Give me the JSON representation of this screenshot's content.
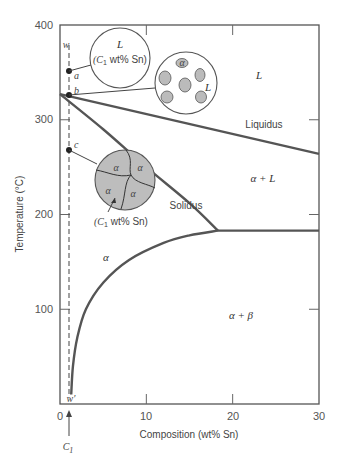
{
  "chart_data": {
    "type": "line",
    "title": "",
    "xlabel": "Composition (wt% Sn)",
    "ylabel": "Temperature (°C)",
    "xlim": [
      0,
      30
    ],
    "ylim": [
      0,
      400
    ],
    "x_ticks": [
      0,
      10,
      20,
      30
    ],
    "y_ticks": [
      100,
      200,
      300,
      400
    ],
    "x_tick_labels": [
      "0",
      "10",
      "20",
      "30"
    ],
    "y_tick_labels": [
      "100",
      "200",
      "300",
      "400"
    ],
    "series": [
      {
        "name": "Liquidus",
        "x": [
          0,
          30
        ],
        "y": [
          327,
          264
        ]
      },
      {
        "name": "Solidus",
        "x": [
          0,
          5,
          10,
          15,
          18.3
        ],
        "y": [
          327,
          290,
          250,
          212,
          183
        ]
      },
      {
        "name": "Eutectic isotherm",
        "x": [
          18.3,
          30
        ],
        "y": [
          183,
          183
        ]
      },
      {
        "name": "Solvus",
        "x": [
          1.3,
          1.5,
          2,
          3,
          5,
          8,
          12,
          15,
          18.3
        ],
        "y": [
          10,
          40,
          70,
          100,
          128,
          152,
          170,
          178,
          183
        ]
      }
    ],
    "composition_line": {
      "label_top": "w",
      "label_bottom": "w′",
      "composition": 1,
      "label": "C1"
    },
    "points": [
      {
        "label": "a",
        "composition": 1,
        "temperature": 350
      },
      {
        "label": "b",
        "composition": 1,
        "temperature": 327
      },
      {
        "label": "c",
        "composition": 1,
        "temperature": 268
      }
    ],
    "phase_regions": [
      {
        "label": "L",
        "x": 23,
        "y": 345
      },
      {
        "label": "α + L",
        "x": 23.5,
        "y": 238
      },
      {
        "label": "α",
        "x": 5,
        "y": 155
      },
      {
        "label": "α + β",
        "x": 21,
        "y": 95
      }
    ],
    "curve_labels": [
      {
        "label": "Liquidus",
        "x": 24,
        "y": 293
      },
      {
        "label": "Solidus",
        "x": 14.5,
        "y": 200
      }
    ],
    "microstructures": [
      {
        "point": "a",
        "phase_label": "L",
        "caption": "(C1 wt% Sn)"
      },
      {
        "point": "b",
        "phase_label": "L",
        "grain_label": "α"
      },
      {
        "point": "c",
        "grain_labels": [
          "α",
          "α",
          "α",
          "α"
        ],
        "caption": "(C1 wt% Sn)"
      }
    ]
  },
  "labels": {
    "xlabel": "Composition (wt% Sn)",
    "ylabel": "Temperature (°C)",
    "liquidus": "Liquidus",
    "solidus": "Solidus",
    "region_L": "L",
    "region_alpha_L": "α + L",
    "region_alpha": "α",
    "region_alpha_beta": "α + β",
    "point_a": "a",
    "point_b": "b",
    "point_c": "c",
    "w": "w",
    "w_prime": "w′",
    "c1_main": "C",
    "c1_sub": "1",
    "circle_a_phase": "L",
    "circle_caption_open": "(C",
    "circle_caption_sub": "1",
    "circle_caption_rest": " wt% Sn)",
    "circle_b_L": "L",
    "circle_b_alpha": "α",
    "alpha": "α",
    "tick_0": "0",
    "tick_10": "10",
    "tick_20": "20",
    "tick_30": "30",
    "tick_100": "100",
    "tick_200": "200",
    "tick_300": "300",
    "tick_400": "400"
  }
}
